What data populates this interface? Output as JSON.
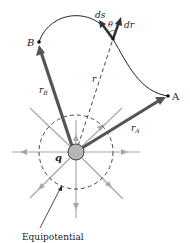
{
  "labels": {
    "point_b": "B",
    "point_a": "A",
    "ds": "ds",
    "theta": "θ",
    "dr": "dr",
    "r": "r",
    "r_b": "r",
    "r_b_sub": "B",
    "r_a": "r",
    "r_a_sub": "A",
    "charge": "q",
    "equipotential": "Equipotential"
  },
  "colors": {
    "vector": "#555555",
    "field_lines": "#a8a8a8",
    "charge_fill": "#b5b5b5",
    "path": "#222222",
    "dashed": "#333333"
  }
}
